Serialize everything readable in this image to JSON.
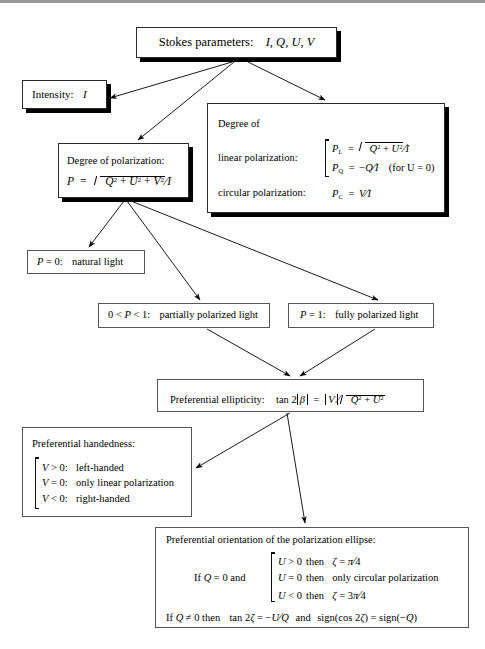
{
  "diagram": {
    "background": "#ffffff",
    "line_color": "#000000"
  },
  "nodes": {
    "stokes": {
      "id": "stokes-parameters",
      "label": "Stokes parameters:",
      "symbols": "I, Q, U, V"
    },
    "intensity": {
      "id": "intensity",
      "label": "Intensity:",
      "symbol": "I"
    },
    "degree_of_polarization": {
      "id": "degree-of-polarization",
      "title": "Degree of polarization:",
      "formula_lhs": "P",
      "equals": "=",
      "radicand": "Q2 + U2 + V2",
      "denominator": "I",
      "formula_plain": "P = sqrt(Q^2 + U^2 + V^2) / I"
    },
    "degree_panel": {
      "id": "degree-of-linear-and-circular-polarization",
      "title": "Degree of",
      "linear_label": "linear polarization:",
      "linear_rows": [
        {
          "lhs": "P",
          "sub": "L",
          "rhs_plain": "sqrt(Q^2 + U^2) / I"
        },
        {
          "lhs": "P",
          "sub": "Q",
          "rhs_plain": "-Q / I",
          "note": "(for U = 0)"
        }
      ],
      "circular_label": "circular polarization:",
      "circular_row": {
        "lhs": "P",
        "sub": "C",
        "rhs_plain": "V / I"
      }
    },
    "natural_light": {
      "id": "natural-light",
      "condition": "P = 0:",
      "result": "natural light"
    },
    "partially_polarized": {
      "id": "partially-polarized-light",
      "condition": "0 < P < 1:",
      "result": "partially polarized light"
    },
    "fully_polarized": {
      "id": "fully-polarized-light",
      "condition": "P = 1:",
      "result": "fully polarized light"
    },
    "ellipticity": {
      "id": "preferential-ellipticity",
      "label": "Preferential ellipticity:",
      "formula_plain": "tan 2|B| = |V| / sqrt(Q^2 + U^2)"
    },
    "handedness": {
      "id": "preferential-handedness",
      "title": "Preferential handedness:",
      "rows": [
        {
          "condition": "V > 0:",
          "result": "left-handed"
        },
        {
          "condition": "V = 0:",
          "result": "only linear polarization"
        },
        {
          "condition": "V < 0:",
          "result": "right-handed"
        }
      ]
    },
    "orientation": {
      "id": "preferential-orientation",
      "title": "Preferential orientation of the polarization ellipse:",
      "case_label": "If Q = 0 and",
      "cases": [
        {
          "condition": "U > 0",
          "then": "then",
          "result_plain": "Z = pi/4"
        },
        {
          "condition": "U = 0",
          "then": "then",
          "result_plain": "only circular polarization"
        },
        {
          "condition": "U < 0",
          "then": "then",
          "result_plain": "Z = 3pi/4"
        }
      ],
      "final_line_plain": "If Q != 0 then tan 2Z = -U/Q and sign(cos 2Z) = sign(-Q)"
    }
  },
  "edges": [
    {
      "from": "stokes",
      "to": "intensity"
    },
    {
      "from": "stokes",
      "to": "degree_of_polarization"
    },
    {
      "from": "stokes",
      "to": "degree_panel"
    },
    {
      "from": "degree_of_polarization",
      "to": "natural_light"
    },
    {
      "from": "degree_of_polarization",
      "to": "partially_polarized"
    },
    {
      "from": "degree_of_polarization",
      "to": "fully_polarized"
    },
    {
      "from": "partially_polarized",
      "to": "ellipticity"
    },
    {
      "from": "fully_polarized",
      "to": "ellipticity"
    },
    {
      "from": "ellipticity",
      "to": "handedness"
    },
    {
      "from": "ellipticity",
      "to": "orientation"
    }
  ]
}
